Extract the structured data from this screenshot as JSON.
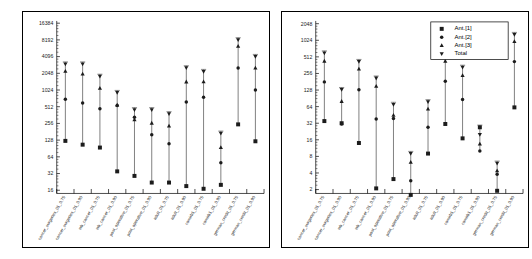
{
  "figure": {
    "background": "#ffffff",
    "marker_color": "#1c1c1c",
    "line_color": "#555555"
  },
  "legend": {
    "position": "top-right-of-right-panel",
    "entries": [
      {
        "label": "Ant.[1]",
        "marker": "square-marker"
      },
      {
        "label": "Ant.[2]",
        "marker": "circle-marker"
      },
      {
        "label": "Ant.[3]",
        "marker": "triangle-up-marker"
      },
      {
        "label": "Total",
        "marker": "triangle-down-marker"
      }
    ]
  },
  "chart_data": [
    {
      "type": "scatter",
      "panel": "left",
      "title": "",
      "xlabel": "",
      "ylabel": "",
      "yscale": "log2",
      "ylim": [
        14,
        18000
      ],
      "yticks": [
        16,
        32,
        64,
        128,
        256,
        512,
        1024,
        2048,
        4096,
        8192,
        16384
      ],
      "ytick_labels": [
        "16",
        "32",
        "64",
        "128",
        "256",
        "512",
        "1024",
        "2048",
        "4096",
        "8192",
        "16384"
      ],
      "grid": false,
      "legend": false,
      "categories": [
        "cancer_surgeries_01_0.75",
        "cancer_surgeries_01_0.90",
        "wb_cancer_01_0.75",
        "wb_cancer_01_0.90",
        "post_operative_01_0.75",
        "post_operative_01_0.90",
        "adult_01_0.75",
        "adult_01_0.90",
        "comirb1_01_0.75",
        "comirb1_01_0.90",
        "german_credit_01_0.75",
        "german_credit_01_0.90"
      ],
      "series": [
        {
          "name": "Ant.[1]",
          "marker": "square-marker",
          "values": [
            124,
            106,
            94,
            35,
            29,
            22,
            22,
            19,
            17,
            20,
            246,
            122
          ]
        },
        {
          "name": "Ant.[2]",
          "marker": "circle-marker",
          "values": [
            700,
            600,
            470,
            540,
            330,
            160,
            110,
            620,
            760,
            50,
            2560,
            1020
          ]
        },
        {
          "name": "Ant.[3]",
          "marker": "triangle-up-marker",
          "values": [
            2240,
            2000,
            1100,
            550,
            300,
            260,
            230,
            1440,
            1450,
            95,
            6300,
            2560
          ]
        },
        {
          "name": "Total",
          "marker": "triangle-down-marker",
          "values": [
            3000,
            3000,
            1800,
            920,
            450,
            450,
            380,
            2560,
            2200,
            170,
            8192,
            4096
          ]
        }
      ]
    },
    {
      "type": "scatter",
      "panel": "right",
      "title": "",
      "xlabel": "",
      "ylabel": "",
      "yscale": "log2",
      "ylim": [
        1.7,
        2300
      ],
      "yticks": [
        2,
        4,
        8,
        16,
        32,
        64,
        128,
        256,
        512,
        1024,
        2048
      ],
      "ytick_labels": [
        "2",
        "4",
        "8",
        "16",
        "32",
        "64",
        "128",
        "256",
        "512",
        "1024",
        "2048"
      ],
      "grid": false,
      "legend": true,
      "categories": [
        "cancer_surgeries_01_0.75",
        "cancer_surgeries_01_0.90",
        "wb_cancer_01_0.75",
        "wb_cancer_01_0.90",
        "post_operative_01_0.75",
        "post_operative_01_0.90",
        "adult_01_0.75",
        "adult_01_0.90",
        "comirb1_01_0.75",
        "comirb1_01_0.90",
        "german_credit_01_0.75",
        "german_credit_01_0.90"
      ],
      "series": [
        {
          "name": "Ant.[1]",
          "marker": "square-marker",
          "values": [
            35,
            32,
            14,
            2.1,
            3.1,
            1.6,
            9,
            31,
            17,
            27,
            1.9,
            62
          ]
        },
        {
          "name": "Ant.[2]",
          "marker": "circle-marker",
          "values": [
            180,
            31,
            130,
            38,
            39,
            2.9,
            27,
            185,
            86,
            10,
            3.8,
            420
          ]
        },
        {
          "name": "Ant.[3]",
          "marker": "triangle-up-marker",
          "values": [
            430,
            80,
            310,
            150,
            45,
            6.3,
            58,
            430,
            235,
            13.5,
            4.4,
            980
          ]
        },
        {
          "name": "Total",
          "marker": "triangle-down-marker",
          "values": [
            600,
            130,
            420,
            210,
            70,
            9,
            78,
            650,
            330,
            20,
            6,
            1300
          ]
        }
      ]
    }
  ]
}
